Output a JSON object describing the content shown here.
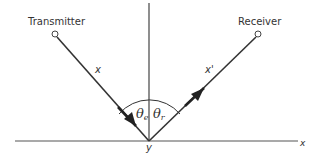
{
  "diagram": {
    "labels": {
      "transmitter": "Transmitter",
      "receiver": "Receiver",
      "incident_ray": "x",
      "reflected_ray": "x'",
      "theta_symbol": "θ",
      "theta_e_sub": "e",
      "theta_r_sub": "r",
      "reflection_point": "y",
      "x_axis": "x"
    },
    "colors": {
      "line": "#333333",
      "axis": "#555555",
      "background": "#ffffff"
    }
  }
}
